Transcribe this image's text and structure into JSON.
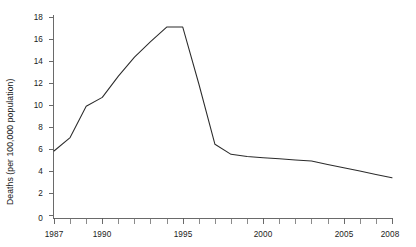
{
  "chart_data": {
    "type": "line",
    "title": "",
    "subtitle": "",
    "xlabel": "",
    "ylabel": "Deaths (per 100,000 population)",
    "xlim": [
      1987,
      2008
    ],
    "ylim": [
      0,
      18
    ],
    "grid": false,
    "legend": false,
    "legend_position": "none",
    "line_color": "#2b2b2b",
    "axis_color": "#5a5a5a",
    "y_ticks": [
      0,
      2,
      4,
      6,
      8,
      10,
      12,
      14,
      16,
      18
    ],
    "y_tick_labels": [
      "0",
      "2",
      "4",
      "6",
      "8",
      "10",
      "12",
      "14",
      "16",
      "18"
    ],
    "y_tick_step": 2,
    "x_ticks": [
      1987,
      1988,
      1989,
      1990,
      1991,
      1992,
      1993,
      1994,
      1995,
      1996,
      1997,
      1998,
      1999,
      2000,
      2001,
      2002,
      2003,
      2004,
      2005,
      2006,
      2007,
      2008
    ],
    "x_labeled_ticks": [
      1987,
      1990,
      1995,
      2000,
      2005,
      2008
    ],
    "x_tick_labels": [
      "1987",
      "1990",
      "1995",
      "2000",
      "2005",
      "2008"
    ],
    "x": [
      1987,
      1988,
      1989,
      1990,
      1991,
      1992,
      1993,
      1994,
      1995,
      1996,
      1997,
      1998,
      1999,
      2000,
      2001,
      2002,
      2003,
      2004,
      2005,
      2006,
      2007,
      2008
    ],
    "values": [
      6.0,
      7.2,
      10.0,
      10.8,
      12.7,
      14.4,
      15.8,
      17.1,
      17.1,
      12.0,
      6.6,
      5.7,
      5.5,
      5.4,
      5.3,
      5.2,
      5.1,
      4.8,
      4.5,
      4.2,
      3.9,
      3.6
    ],
    "series": [
      {
        "name": "Deaths per 100,000 population",
        "values": [
          6.0,
          7.2,
          10.0,
          10.8,
          12.7,
          14.4,
          15.8,
          17.1,
          17.1,
          12.0,
          6.6,
          5.7,
          5.5,
          5.4,
          5.3,
          5.2,
          5.1,
          4.8,
          4.5,
          4.2,
          3.9,
          3.6
        ]
      }
    ],
    "annotations": [],
    "peak_value": 17.1,
    "peak_years": [
      1994,
      1995
    ],
    "start_value": 6.0,
    "end_value": 3.6
  },
  "axes": {
    "y_title": "Deaths (per 100,000 population)"
  }
}
